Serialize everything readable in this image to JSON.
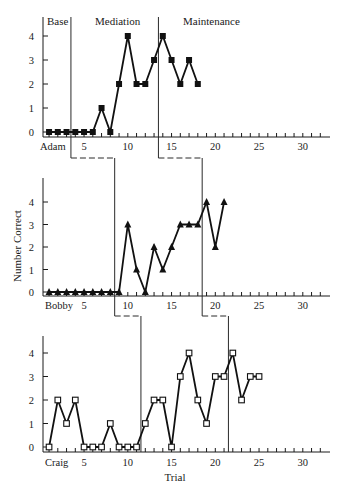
{
  "chart_data": {
    "type": "line",
    "title": "",
    "xlabel": "Trial",
    "ylabel": "Number Correct",
    "xlim": [
      0,
      33
    ],
    "ylim": [
      0,
      4
    ],
    "x_ticks": [
      5,
      10,
      15,
      20,
      25,
      30
    ],
    "y_ticks": [
      0,
      1,
      2,
      3,
      4
    ],
    "grid": false,
    "legend": null,
    "phase_labels": [
      "Base",
      "Mediation",
      "Maintenance"
    ],
    "panels": [
      {
        "name": "Adam",
        "marker": "filled-square",
        "phase_changes_after_trial": [
          3.5,
          13.5
        ],
        "x": [
          1,
          2,
          3,
          4,
          5,
          6,
          7,
          8,
          9,
          10,
          11,
          12,
          13,
          14,
          15,
          16,
          17,
          18
        ],
        "values": [
          0,
          0,
          0,
          0,
          0,
          0,
          1,
          0,
          2,
          4,
          2,
          2,
          3,
          4,
          3,
          2,
          3,
          2
        ]
      },
      {
        "name": "Bobby",
        "marker": "filled-triangle",
        "phase_changes_after_trial": [
          8.5,
          18.5
        ],
        "x": [
          1,
          2,
          3,
          4,
          5,
          6,
          7,
          8,
          9,
          10,
          11,
          12,
          13,
          14,
          15,
          16,
          17,
          18,
          19,
          20,
          21
        ],
        "values": [
          0,
          0,
          0,
          0,
          0,
          0,
          0,
          0,
          0,
          3,
          1,
          0,
          2,
          1,
          2,
          3,
          3,
          3,
          4,
          2,
          4
        ]
      },
      {
        "name": "Craig",
        "marker": "open-square",
        "phase_changes_after_trial": [
          11.5,
          21.5
        ],
        "x": [
          1,
          2,
          3,
          4,
          5,
          6,
          7,
          8,
          9,
          10,
          11,
          12,
          13,
          14,
          15,
          16,
          17,
          18,
          19,
          20,
          21,
          22,
          23,
          24,
          25
        ],
        "values": [
          0,
          2,
          1,
          2,
          0,
          0,
          0,
          1,
          0,
          0,
          0,
          1,
          2,
          2,
          0,
          3,
          4,
          2,
          1,
          3,
          3,
          4,
          2,
          3,
          3
        ]
      }
    ]
  },
  "labels": {
    "phase_base": "Base",
    "phase_mediation": "Mediation",
    "phase_maintenance": "Maintenance",
    "ylabel": "Number Correct",
    "xlabel": "Trial",
    "panel_adam": "Adam",
    "panel_bobby": "Bobby",
    "panel_craig": "Craig"
  }
}
